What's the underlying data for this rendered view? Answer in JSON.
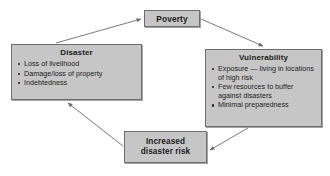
{
  "diagram": {
    "type": "cycle-diagram",
    "box_fill_color": "#c6c6c6",
    "box_border_color": "#6d6d6d",
    "arrow_color": "#6b6b6b",
    "text_color": "#1c1c1c",
    "background_color": "#ffffff",
    "nodes": [
      {
        "id": "poverty",
        "title": "Poverty",
        "bullets": []
      },
      {
        "id": "disaster",
        "title": "Disaster",
        "bullets": [
          "Loss of livelihood",
          "Damage/loss of property",
          "Indebtedness"
        ]
      },
      {
        "id": "vulnerability",
        "title": "Vulnerability",
        "bullets": [
          "Exposure — living in locations of high risk",
          "Few resources to buffer against disasters",
          "Minimal preparedness"
        ]
      },
      {
        "id": "increased_risk",
        "title": "Increased disaster risk",
        "bullets": []
      }
    ],
    "arrows": [
      {
        "id": "disaster-to-poverty",
        "from": "disaster",
        "to": "poverty"
      },
      {
        "id": "poverty-to-vulnerability",
        "from": "poverty",
        "to": "vulnerability"
      },
      {
        "id": "vulnerability-to-increased-risk",
        "from": "vulnerability",
        "to": "increased_risk"
      },
      {
        "id": "increased-risk-to-disaster",
        "from": "increased_risk",
        "to": "disaster"
      }
    ]
  }
}
